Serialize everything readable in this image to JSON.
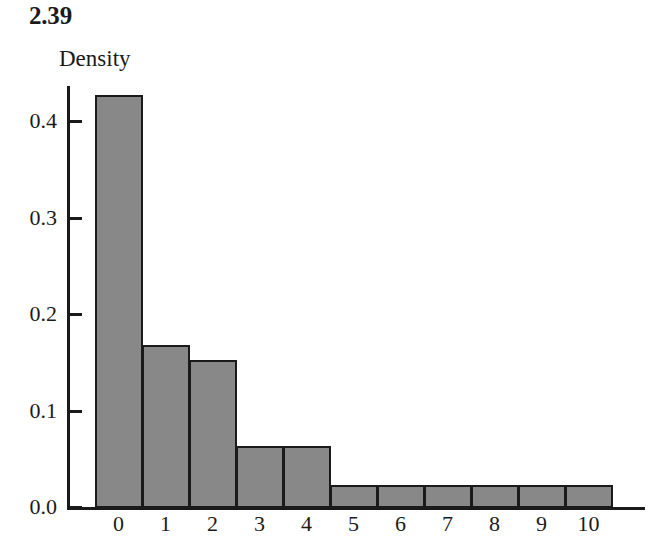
{
  "figure": {
    "title": "2.39",
    "y_axis_title": "Density"
  },
  "chart_data": {
    "type": "bar",
    "title": "2.39",
    "xlabel": "",
    "ylabel": "Density",
    "categories": [
      "0",
      "1",
      "2",
      "3",
      "4",
      "5",
      "6",
      "7",
      "8",
      "9",
      "10"
    ],
    "values": [
      0.427,
      0.168,
      0.152,
      0.063,
      0.063,
      0.023,
      0.023,
      0.023,
      0.023,
      0.023,
      0.023
    ],
    "yticks": [
      "0.0",
      "0.1",
      "0.2",
      "0.3",
      "0.4"
    ],
    "ytick_values": [
      0.0,
      0.1,
      0.2,
      0.3,
      0.4
    ],
    "ylim": [
      0.0,
      0.44
    ],
    "xlim": [
      -0.5,
      10.5
    ],
    "grid": false,
    "legend": false,
    "bar_fill_color": "#888888",
    "bar_edge_color": "#1a1a1a",
    "axis_color": "#1a1a1a",
    "background_color": "#ffffff"
  }
}
